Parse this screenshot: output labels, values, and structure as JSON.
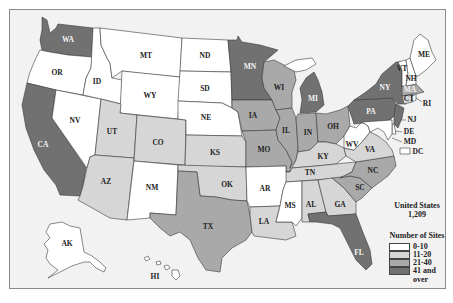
{
  "colors": {
    "c0_10": "#ffffff",
    "c11_20": "#d6d6d6",
    "c21_40": "#a9a9a9",
    "c41_over": "#717171",
    "ocean": "#f2f2f2",
    "border": "#3a3a3a"
  },
  "summary": {
    "region": "United States",
    "total": "1,209"
  },
  "legend": {
    "title": "Number of Sites",
    "items": [
      {
        "range": "0-10",
        "color": "#ffffff"
      },
      {
        "range": "11-20",
        "color": "#d6d6d6"
      },
      {
        "range": "21-40",
        "color": "#a9a9a9"
      },
      {
        "range": "41 and",
        "continuation": "over",
        "color": "#717171"
      }
    ]
  },
  "states": [
    {
      "code": "WA",
      "category": "41 and over"
    },
    {
      "code": "OR",
      "category": "0-10"
    },
    {
      "code": "CA",
      "category": "41 and over"
    },
    {
      "code": "NV",
      "category": "0-10"
    },
    {
      "code": "ID",
      "category": "0-10"
    },
    {
      "code": "MT",
      "category": "0-10"
    },
    {
      "code": "WY",
      "category": "0-10"
    },
    {
      "code": "UT",
      "category": "11-20"
    },
    {
      "code": "AZ",
      "category": "11-20"
    },
    {
      "code": "CO",
      "category": "11-20"
    },
    {
      "code": "NM",
      "category": "0-10"
    },
    {
      "code": "ND",
      "category": "0-10"
    },
    {
      "code": "SD",
      "category": "0-10"
    },
    {
      "code": "NE",
      "category": "0-10"
    },
    {
      "code": "KS",
      "category": "11-20"
    },
    {
      "code": "OK",
      "category": "11-20"
    },
    {
      "code": "TX",
      "category": "21-40"
    },
    {
      "code": "MN",
      "category": "41 and over"
    },
    {
      "code": "IA",
      "category": "21-40"
    },
    {
      "code": "MO",
      "category": "21-40"
    },
    {
      "code": "AR",
      "category": "0-10"
    },
    {
      "code": "LA",
      "category": "11-20"
    },
    {
      "code": "WI",
      "category": "21-40"
    },
    {
      "code": "IL",
      "category": "21-40"
    },
    {
      "code": "MI",
      "category": "41 and over"
    },
    {
      "code": "IN",
      "category": "21-40"
    },
    {
      "code": "OH",
      "category": "21-40"
    },
    {
      "code": "KY",
      "category": "11-20"
    },
    {
      "code": "TN",
      "category": "11-20"
    },
    {
      "code": "MS",
      "category": "0-10"
    },
    {
      "code": "AL",
      "category": "11-20"
    },
    {
      "code": "GA",
      "category": "11-20"
    },
    {
      "code": "FL",
      "category": "41 and over"
    },
    {
      "code": "SC",
      "category": "21-40"
    },
    {
      "code": "NC",
      "category": "21-40"
    },
    {
      "code": "VA",
      "category": "11-20"
    },
    {
      "code": "WV",
      "category": "0-10"
    },
    {
      "code": "PA",
      "category": "41 and over"
    },
    {
      "code": "NY",
      "category": "41 and over"
    },
    {
      "code": "NJ",
      "category": "41 and over"
    },
    {
      "code": "DE",
      "category": "0-10"
    },
    {
      "code": "MD",
      "category": "0-10"
    },
    {
      "code": "DC",
      "category": "0-10"
    },
    {
      "code": "CT",
      "category": "11-20"
    },
    {
      "code": "RI",
      "category": "0-10"
    },
    {
      "code": "MA",
      "category": "21-40"
    },
    {
      "code": "VT",
      "category": "0-10"
    },
    {
      "code": "NH",
      "category": "0-10"
    },
    {
      "code": "ME",
      "category": "0-10"
    },
    {
      "code": "AK",
      "category": "0-10"
    },
    {
      "code": "HI",
      "category": "0-10"
    }
  ],
  "labels": {
    "WA": "WA",
    "OR": "OR",
    "CA": "CA",
    "NV": "NV",
    "ID": "ID",
    "MT": "MT",
    "WY": "WY",
    "UT": "UT",
    "AZ": "AZ",
    "CO": "CO",
    "NM": "NM",
    "ND": "ND",
    "SD": "SD",
    "NE": "NE",
    "KS": "KS",
    "OK": "OK",
    "TX": "TX",
    "MN": "MN",
    "IA": "IA",
    "MO": "MO",
    "AR": "AR",
    "LA": "LA",
    "WI": "WI",
    "IL": "IL",
    "MI": "MI",
    "IN": "IN",
    "OH": "OH",
    "KY": "KY",
    "TN": "TN",
    "MS": "MS",
    "AL": "AL",
    "GA": "GA",
    "FL": "FL",
    "SC": "SC",
    "NC": "NC",
    "VA": "VA",
    "WV": "WV",
    "PA": "PA",
    "NY": "NY",
    "NJ": "NJ",
    "DE": "DE",
    "MD": "MD",
    "DC": "DC",
    "CT": "CT",
    "RI": "RI",
    "MA": "MA",
    "VT": "VT",
    "NH": "NH",
    "ME": "ME",
    "AK": "AK",
    "HI": "HI"
  }
}
